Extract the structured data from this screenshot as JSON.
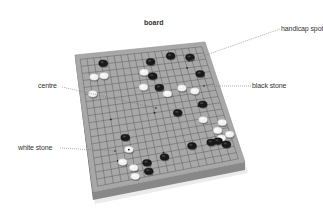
{
  "title": "board",
  "labels": {
    "handicap_spot": "handicap spot",
    "black_stone": "black stone",
    "centre": "centre",
    "white_stone": "white stone"
  },
  "colors": {
    "board_top": "#a8a8a8",
    "board_side": "#6e6e6e",
    "board_front": "#888888",
    "grid": "#555555",
    "black_stone": "#1a1a1a",
    "white_stone": "#f2f2f2",
    "leader": "#777777",
    "text": "#333333"
  },
  "board": {
    "grid_size": 19,
    "corners": {
      "top_left": [
        75,
        55
      ],
      "top_right": [
        205,
        42
      ],
      "bottom_right": [
        245,
        162
      ],
      "bottom_left": [
        93,
        192
      ]
    },
    "thickness": 8
  },
  "stones": [
    {
      "color": "black",
      "u": 0.18,
      "v": 0.05
    },
    {
      "color": "black",
      "u": 0.56,
      "v": 0.08
    },
    {
      "color": "black",
      "u": 0.73,
      "v": 0.05
    },
    {
      "color": "black",
      "u": 0.88,
      "v": 0.08
    },
    {
      "color": "white",
      "u": 0.09,
      "v": 0.15
    },
    {
      "color": "white",
      "u": 0.17,
      "v": 0.15
    },
    {
      "color": "white",
      "u": 0.49,
      "v": 0.16
    },
    {
      "color": "black",
      "u": 0.55,
      "v": 0.2
    },
    {
      "color": "white",
      "u": 0.06,
      "v": 0.28
    },
    {
      "color": "white",
      "u": 0.46,
      "v": 0.28
    },
    {
      "color": "black",
      "u": 0.58,
      "v": 0.3
    },
    {
      "color": "black",
      "u": 0.92,
      "v": 0.23
    },
    {
      "color": "white",
      "u": 0.63,
      "v": 0.36
    },
    {
      "color": "white",
      "u": 0.75,
      "v": 0.33
    },
    {
      "color": "white",
      "u": 0.84,
      "v": 0.37
    },
    {
      "color": "black",
      "u": 0.67,
      "v": 0.53
    },
    {
      "color": "black",
      "u": 0.87,
      "v": 0.49
    },
    {
      "color": "white",
      "u": 0.84,
      "v": 0.62
    },
    {
      "color": "black",
      "u": 0.25,
      "v": 0.66
    },
    {
      "color": "white",
      "u": 0.97,
      "v": 0.67
    },
    {
      "color": "white",
      "u": 0.92,
      "v": 0.73
    },
    {
      "color": "white",
      "u": 0.93,
      "v": 0.8
    },
    {
      "color": "white",
      "u": 1.0,
      "v": 0.78
    },
    {
      "color": "white",
      "u": 0.26,
      "v": 0.76,
      "marked": true
    },
    {
      "color": "black",
      "u": 0.71,
      "v": 0.82
    },
    {
      "color": "black",
      "u": 0.85,
      "v": 0.82
    },
    {
      "color": "black",
      "u": 0.9,
      "v": 0.82
    },
    {
      "color": "black",
      "u": 0.95,
      "v": 0.86
    },
    {
      "color": "white",
      "u": 0.2,
      "v": 0.85
    },
    {
      "color": "black",
      "u": 0.5,
      "v": 0.87
    },
    {
      "color": "black",
      "u": 0.37,
      "v": 0.89
    },
    {
      "color": "black",
      "u": 0.37,
      "v": 0.96
    },
    {
      "color": "white",
      "u": 0.27,
      "v": 0.91
    },
    {
      "color": "white",
      "u": 0.27,
      "v": 0.98
    }
  ],
  "hoshi": [
    {
      "u": 0.1667,
      "v": 0.1667
    },
    {
      "u": 0.5,
      "v": 0.1667
    },
    {
      "u": 0.8333,
      "v": 0.1667
    },
    {
      "u": 0.1667,
      "v": 0.5
    },
    {
      "u": 0.5,
      "v": 0.5
    },
    {
      "u": 0.8333,
      "v": 0.5
    },
    {
      "u": 0.1667,
      "v": 0.8333
    },
    {
      "u": 0.5,
      "v": 0.8333
    },
    {
      "u": 0.8333,
      "v": 0.8333
    }
  ],
  "leaders": {
    "handicap_spot": {
      "from": [
        280,
        29
      ],
      "to": [
        189,
        61
      ]
    },
    "black_stone": {
      "from": [
        251,
        86
      ],
      "to": [
        204,
        86
      ]
    },
    "centre": {
      "from": [
        62,
        87
      ],
      "to": [
        156,
        108
      ]
    },
    "white_stone": {
      "from": [
        60,
        148
      ],
      "to": [
        115,
        151
      ]
    }
  }
}
